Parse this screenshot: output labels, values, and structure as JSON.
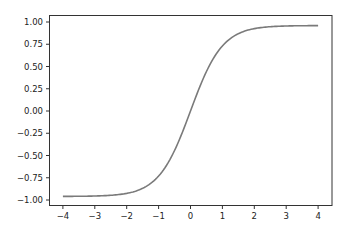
{
  "chart_data": {
    "type": "line",
    "title": "",
    "xlabel": "",
    "ylabel": "",
    "xlim": [
      -4.4,
      4.4
    ],
    "ylim": [
      -1.06,
      1.06
    ],
    "grid": false,
    "legend": null,
    "x_ticks": [
      "−4",
      "−3",
      "−2",
      "−1",
      "0",
      "1",
      "2",
      "3",
      "4"
    ],
    "x_tick_values": [
      -4,
      -3,
      -2,
      -1,
      0,
      1,
      2,
      3,
      4
    ],
    "y_ticks": [
      "1.00",
      "0.75",
      "0.50",
      "0.25",
      "0.00",
      "−0.25",
      "−0.50",
      "−0.75",
      "−1.00"
    ],
    "y_tick_values": [
      1.0,
      0.75,
      0.5,
      0.25,
      0.0,
      -0.25,
      -0.5,
      -0.75,
      -1.0
    ],
    "series": [
      {
        "name": "tanh(x)",
        "color": "#7a7a7a",
        "x": [
          -4,
          -3.5,
          -3,
          -2.5,
          -2,
          -1.5,
          -1,
          -0.5,
          0,
          0.5,
          1,
          1.5,
          2,
          2.5,
          3,
          3.5,
          4
        ],
        "y": [
          -0.999,
          -0.998,
          -0.995,
          -0.987,
          -0.964,
          -0.905,
          -0.762,
          -0.462,
          0.0,
          0.462,
          0.762,
          0.905,
          0.964,
          0.987,
          0.995,
          0.998,
          0.999
        ]
      }
    ]
  }
}
